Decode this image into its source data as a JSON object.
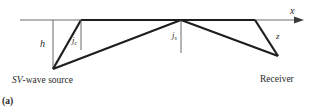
{
  "figure": {
    "panel_label": "(a)",
    "axis_label": "x",
    "depth_label_source": "h",
    "depth_label_receiver": "z",
    "critical_angle_label": "j",
    "critical_angle_sub": "c",
    "specular_angle_label": "j",
    "specular_angle_sub": "s",
    "source_label_italic": "SV",
    "source_label_rest": "-wave source",
    "receiver_label": "Receiver"
  },
  "colors": {
    "ray": "#1e1e1e",
    "guide": "#6a6a6a",
    "text": "#2a2a2a"
  }
}
